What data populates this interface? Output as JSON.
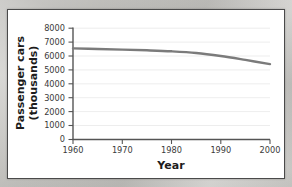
{
  "panel": {
    "background_color": "#ffffff",
    "border_color": "#4a4a4a"
  },
  "chart_data": {
    "type": "line",
    "title": "",
    "subtitle": "",
    "xlabel": "Year",
    "ylabel": "Passenger cars (thousands)",
    "ylabel_line1": "Passenger cars",
    "ylabel_line2": "(thousands)",
    "xlim": [
      1960,
      2000
    ],
    "ylim": [
      0,
      8000
    ],
    "xticks": [
      1960,
      1970,
      1980,
      1990,
      2000
    ],
    "xtick_labels": [
      "1960",
      "1970",
      "1980",
      "1990",
      "2000"
    ],
    "yticks": [
      0,
      1000,
      2000,
      3000,
      4000,
      5000,
      6000,
      7000,
      8000
    ],
    "ytick_labels": [
      "0",
      "1000",
      "2000",
      "3000",
      "4000",
      "5000",
      "6000",
      "7000",
      "8000"
    ],
    "grid": true,
    "grid_axis": "y",
    "legend": false,
    "legend_position": "none",
    "line_color": "#7b7b7b",
    "series": [
      {
        "name": "Passenger cars",
        "x": [
          1960,
          1965,
          1970,
          1975,
          1980,
          1985,
          1990,
          1995,
          2000
        ],
        "values": [
          6550,
          6500,
          6460,
          6410,
          6340,
          6220,
          6000,
          5720,
          5420
        ]
      }
    ]
  }
}
